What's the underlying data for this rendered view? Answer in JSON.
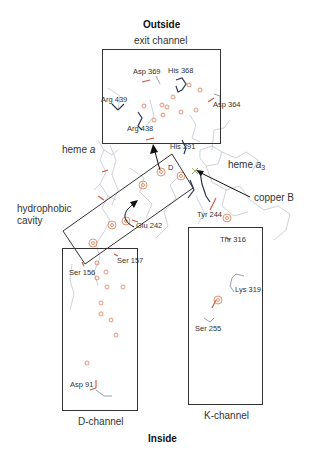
{
  "titles": {
    "top": "Outside",
    "bottom": "Inside"
  },
  "regions": {
    "exit_channel": "exit channel",
    "heme_a_prefix": "heme ",
    "heme_a_italic": "a",
    "heme_a3_prefix": "heme ",
    "heme_a3_italic": "a",
    "heme_a3_sub": "3",
    "hydrophobic_cavity_line1": "hydrophobic",
    "hydrophobic_cavity_line2": "cavity",
    "copper_b": "copper B",
    "d_channel": "D-channel",
    "k_channel": "K-channel",
    "d_marker": "D"
  },
  "residues": {
    "asp369": "Asp 369",
    "his368": "His 368",
    "arg439": "Arg 439",
    "asp364": "Asp 364",
    "arg438": "Arg 438",
    "his291": "His 291",
    "glu242": "Glu 242",
    "tyr244": "Tyr 244",
    "thr316": "Thr 316",
    "ser156": "Ser 156",
    "ser157": "Ser 157",
    "lys319": "Lys 319",
    "ser255": "Ser 255",
    "asp91": "Asp 91"
  },
  "colors": {
    "water": "#e07a50",
    "box": "#333333",
    "protein_light": "#a8b0c0",
    "protein_dark": "#2a3550",
    "acid": "#d0553a"
  }
}
